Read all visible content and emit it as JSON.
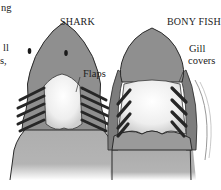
{
  "figure": {
    "left_panel": {
      "title": "SHARK",
      "label_flaps": "Flaps"
    },
    "right_panel": {
      "title": "BONY FISH",
      "label_gill_line1": "Gill",
      "label_gill_line2": "covers"
    },
    "cutoff_text": {
      "line1": "ng",
      "line2": "ll",
      "line3": "s,"
    },
    "colors": {
      "head_fill": "#8f8f8f",
      "body_fill": "#a8a8a8",
      "outline": "#2a2a2a",
      "gill_slit": "#262626",
      "throat": "#f2f2f2"
    }
  }
}
